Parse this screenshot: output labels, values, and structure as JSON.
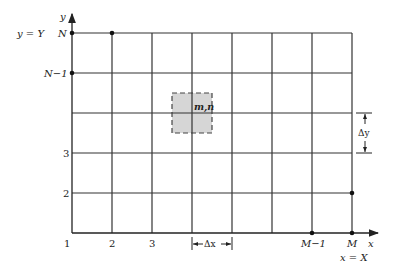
{
  "diagram": {
    "type": "finite-difference grid",
    "axes": {
      "x_label": "x",
      "y_label": "y",
      "x_boundary": "x = X",
      "y_boundary": "y = Y"
    },
    "x_ticks": [
      "1",
      "2",
      "3",
      "M−1",
      "M"
    ],
    "y_ticks": [
      "N",
      "N−1",
      "3",
      "2"
    ],
    "origin_label": "1",
    "cell_label": "m,n",
    "dx_label": "Δx",
    "dy_label": "Δy",
    "colors": {
      "line": "#222222",
      "cell_fill": "#d6d6d6"
    }
  }
}
